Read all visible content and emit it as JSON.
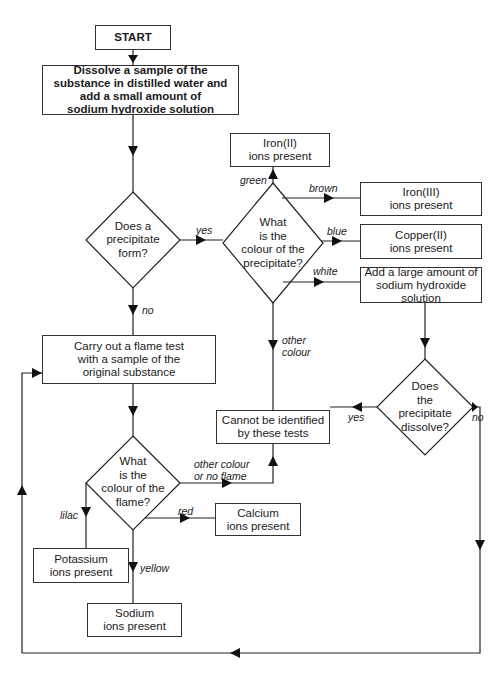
{
  "nodes": {
    "start": "START",
    "dissolve": "Dissolve a sample of the\nsubstance in distilled water and\nadd a small amount of\nsodium hydroxide solution",
    "q_precipitate": "Does a\nprecipitate\nform?",
    "q_colour_precipitate": "What\nis the\ncolour of the\nprecipitate?",
    "iron2": "Iron(II)\nions present",
    "iron3": "Iron(III)\nions present",
    "copper2": "Copper(II)\nions present",
    "add_naoh": "Add a large amount of\nsodium hydroxide\nsolution",
    "flame_test": "Carry out a flame test\nwith a sample of the\noriginal substance",
    "q_dissolve": "Does\nthe\nprecipitate\ndissolve?",
    "cannot_identify": "Cannot be identified\nby these tests",
    "q_colour_flame": "What\nis the\ncolour of the\nflame?",
    "calcium": "Calcium\nions present",
    "potassium": "Potassium\nions present",
    "sodium": "Sodium\nions present"
  },
  "edge_labels": {
    "yes_precipitate": "yes",
    "no_precipitate": "no",
    "green": "green",
    "brown": "brown",
    "blue": "blue",
    "white": "white",
    "other_colour": "other\ncolour",
    "yes_dissolve": "yes",
    "no_dissolve": "no",
    "other_colour_no_flame": "other colour\nor no flame",
    "red": "red",
    "lilac": "lilac",
    "yellow": "yellow"
  }
}
